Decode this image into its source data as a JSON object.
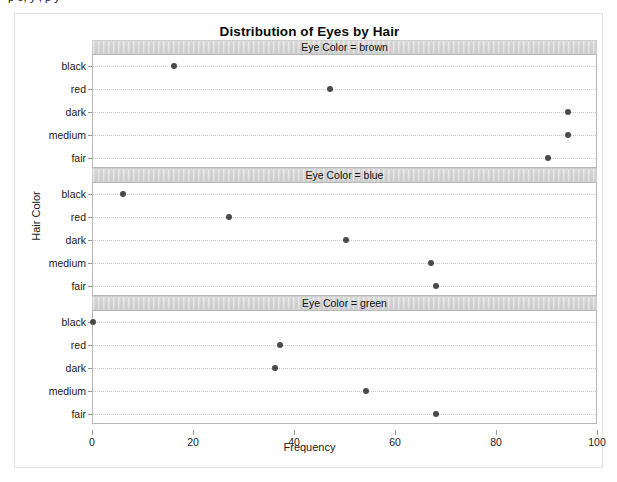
{
  "partial_top_text": "p                    e, y , p  y",
  "figure": {
    "title": "Distribution of Eyes by Hair",
    "x_title": "Frequency",
    "y_title": "Hair Color"
  },
  "axis": {
    "x_ticks": [
      "0",
      "20",
      "40",
      "60",
      "80",
      "100"
    ],
    "y_ticks": [
      "black",
      "red",
      "dark",
      "medium",
      "fair"
    ]
  },
  "panels": [
    {
      "label": "Eye Color = brown"
    },
    {
      "label": "Eye Color = blue"
    },
    {
      "label": "Eye Color = green"
    }
  ],
  "colors": {
    "point": "#4a4a4a",
    "panel_strip": "#d6d6d6",
    "panel_border": "#b9b9b9",
    "gridline": "#c9c9c9",
    "frame": "#e2e2e2",
    "text": "#1a1a1a"
  },
  "chart_data": {
    "type": "scatter",
    "title": "Distribution of Eyes by Hair",
    "xlabel": "Frequency",
    "ylabel": "Hair Color",
    "xlim": [
      0,
      100
    ],
    "xticks": [
      0,
      20,
      40,
      60,
      80,
      100
    ],
    "categories": [
      "black",
      "red",
      "dark",
      "medium",
      "fair"
    ],
    "grid": true,
    "legend": "none",
    "facet_by": "Eye Color",
    "panels": [
      {
        "label": "Eye Color = brown",
        "facet_value": "brown",
        "points": [
          {
            "hair": "black",
            "frequency": 16
          },
          {
            "hair": "red",
            "frequency": 47
          },
          {
            "hair": "dark",
            "frequency": 94
          },
          {
            "hair": "medium",
            "frequency": 94
          },
          {
            "hair": "fair",
            "frequency": 90
          }
        ]
      },
      {
        "label": "Eye Color = blue",
        "facet_value": "blue",
        "points": [
          {
            "hair": "black",
            "frequency": 6
          },
          {
            "hair": "red",
            "frequency": 27
          },
          {
            "hair": "dark",
            "frequency": 50
          },
          {
            "hair": "medium",
            "frequency": 67
          },
          {
            "hair": "fair",
            "frequency": 68
          }
        ]
      },
      {
        "label": "Eye Color = green",
        "facet_value": "green",
        "points": [
          {
            "hair": "black",
            "frequency": 0
          },
          {
            "hair": "red",
            "frequency": 37
          },
          {
            "hair": "dark",
            "frequency": 36
          },
          {
            "hair": "medium",
            "frequency": 54
          },
          {
            "hair": "fair",
            "frequency": 68
          }
        ]
      }
    ]
  }
}
